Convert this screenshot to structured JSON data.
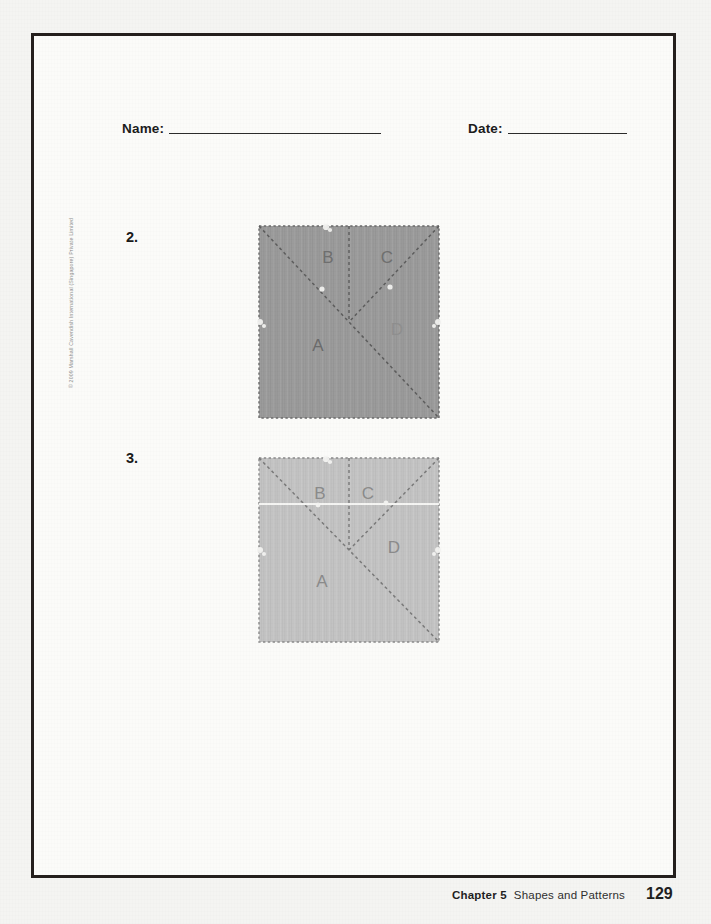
{
  "page": {
    "background_color": "#f4f4f2",
    "frame_color": "#241f1d"
  },
  "header": {
    "name_label": "Name:",
    "date_label": "Date:"
  },
  "questions": [
    {
      "number": "2.",
      "figure": {
        "shape": "square",
        "fill_color": "#9b9b9b",
        "border_style": "dashed",
        "label_color": "#6f6f6f",
        "labels": [
          {
            "text": "A",
            "x": 62,
            "y": 128
          },
          {
            "text": "B",
            "x": 72,
            "y": 40
          },
          {
            "text": "C",
            "x": 131,
            "y": 40
          },
          {
            "text": "D",
            "x": 141,
            "y": 112
          }
        ]
      }
    },
    {
      "number": "3.",
      "figure": {
        "shape": "square",
        "fill_color": "#c3c3c3",
        "border_style": "dashed",
        "label_color": "#8b8b8b",
        "labels": [
          {
            "text": "A",
            "x": 66,
            "y": 132
          },
          {
            "text": "B",
            "x": 64,
            "y": 44
          },
          {
            "text": "C",
            "x": 112,
            "y": 44
          },
          {
            "text": "D",
            "x": 138,
            "y": 98
          }
        ]
      }
    }
  ],
  "copyright": {
    "text": "© 2009 Marshall Cavendish International (Singapore) Private Limited"
  },
  "footer": {
    "chapter": "Chapter 5",
    "title": "Shapes and Patterns",
    "page_number": "129"
  }
}
